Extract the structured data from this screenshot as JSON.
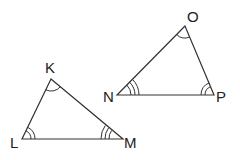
{
  "diagram": {
    "type": "similar-triangles",
    "triangles": [
      {
        "name": "KLM",
        "vertices": {
          "K": {
            "label": "K",
            "x": 51,
            "y": 79,
            "arc_count": 1
          },
          "L": {
            "label": "L",
            "x": 22,
            "y": 139,
            "arc_count": 2
          },
          "M": {
            "label": "M",
            "x": 123,
            "y": 139,
            "arc_count": 3
          }
        }
      },
      {
        "name": "NOP",
        "vertices": {
          "O": {
            "label": "O",
            "x": 185,
            "y": 26,
            "arc_count": 1
          },
          "N": {
            "label": "N",
            "x": 117,
            "y": 95,
            "arc_count": 3
          },
          "P": {
            "label": "P",
            "x": 214,
            "y": 95,
            "arc_count": 2
          }
        }
      }
    ],
    "colors": {
      "stroke": "#333333",
      "background": "#ffffff"
    }
  }
}
